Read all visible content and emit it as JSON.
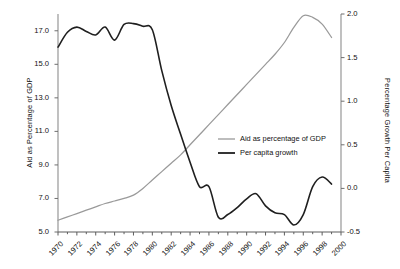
{
  "chart_data": {
    "type": "line",
    "title": "",
    "xlabel": "",
    "ylabel": "Aid as Percentage of GDP",
    "y2label": "Percentage Growth Per Capita",
    "grid": false,
    "legend_position": "center-right",
    "xlim": [
      1970,
      2000
    ],
    "ylim": [
      5.0,
      18.0
    ],
    "y2lim": [
      -0.5,
      2.0
    ],
    "x_tick_labels": [
      "1970",
      "1972",
      "1974",
      "1976",
      "1978",
      "1980",
      "1982",
      "1984",
      "1986",
      "1988",
      "1990",
      "1992",
      "1994",
      "1996",
      "1998",
      "2000"
    ],
    "x_tick_values": [
      1970,
      1972,
      1974,
      1976,
      1978,
      1980,
      1982,
      1984,
      1986,
      1988,
      1990,
      1992,
      1994,
      1996,
      1998,
      2000
    ],
    "x_minor_ticks": [
      1971,
      1973,
      1975,
      1977,
      1979,
      1981,
      1983,
      1985,
      1987,
      1989,
      1991,
      1993,
      1995,
      1997,
      1999
    ],
    "y_tick_labels": [
      "5.0",
      "7.0",
      "9.0",
      "11.0",
      "13.0",
      "15.0",
      "17.0"
    ],
    "y_tick_values": [
      5.0,
      7.0,
      9.0,
      11.0,
      13.0,
      15.0,
      17.0
    ],
    "y2_tick_labels": [
      "-0.5",
      "0.0",
      "0.5",
      "1.0",
      "1.5",
      "2.0"
    ],
    "y2_tick_values": [
      -0.5,
      0.0,
      0.5,
      1.0,
      1.5,
      2.0
    ],
    "x": [
      1970,
      1971,
      1972,
      1973,
      1974,
      1975,
      1976,
      1977,
      1978,
      1979,
      1980,
      1981,
      1982,
      1983,
      1984,
      1985,
      1986,
      1987,
      1988,
      1989,
      1990,
      1991,
      1992,
      1993,
      1994,
      1995,
      1996,
      1997,
      1998,
      1999
    ],
    "series": [
      {
        "name": "Aid as percentage of GDP",
        "axis": "left",
        "color": "#9a9a9a",
        "values": [
          5.7,
          5.9,
          6.1,
          6.3,
          6.5,
          6.7,
          6.85,
          7.0,
          7.2,
          7.6,
          8.1,
          8.6,
          9.1,
          9.6,
          10.2,
          10.8,
          11.4,
          12.0,
          12.6,
          13.2,
          13.8,
          14.4,
          15.0,
          15.6,
          16.3,
          17.2,
          17.9,
          17.8,
          17.4,
          16.6
        ]
      },
      {
        "name": "Per capita growth",
        "axis": "right",
        "color": "#1f1f1f",
        "values": [
          1.62,
          1.79,
          1.85,
          1.8,
          1.76,
          1.85,
          1.7,
          1.88,
          1.89,
          1.86,
          1.82,
          1.35,
          0.95,
          0.62,
          0.3,
          0.02,
          0.02,
          -0.33,
          -0.3,
          -0.22,
          -0.12,
          -0.06,
          -0.2,
          -0.28,
          -0.3,
          -0.42,
          -0.3,
          0.02,
          0.13,
          0.05
        ]
      }
    ]
  },
  "left_axis": {
    "title": "Aid as Percentage of GDP"
  },
  "right_axis": {
    "title": "Percentage Growth Per Capita"
  },
  "legend": {
    "entries": [
      {
        "label": "Aid as percentage of GDP",
        "color": "#9a9a9a"
      },
      {
        "label": "Per capita growth",
        "color": "#1f1f1f"
      }
    ]
  }
}
